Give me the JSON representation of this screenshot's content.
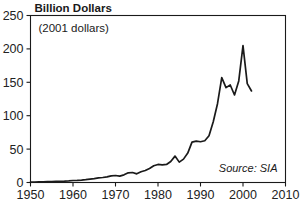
{
  "chart_data": {
    "type": "line",
    "title": "Billion Dollars",
    "subtitle": "(2001 dollars)",
    "annotation": "Source: SIA",
    "xlabel": "",
    "ylabel": "Billion Dollars",
    "xlim": [
      1950,
      2010
    ],
    "ylim": [
      0,
      250
    ],
    "grid": false,
    "legend": "none",
    "xticks": [
      "1950",
      "1960",
      "1970",
      "1980",
      "1990",
      "2000",
      "2010"
    ],
    "xtick_values": [
      1950,
      1960,
      1970,
      1980,
      1990,
      2000,
      2010
    ],
    "yticks": [
      "0",
      "50",
      "100",
      "150",
      "200",
      "250"
    ],
    "ytick_values": [
      0,
      50,
      100,
      150,
      200,
      250
    ],
    "line_color": "#1a1a1a",
    "x": [
      1950,
      1951,
      1952,
      1953,
      1954,
      1955,
      1956,
      1957,
      1958,
      1959,
      1960,
      1961,
      1962,
      1963,
      1964,
      1965,
      1966,
      1967,
      1968,
      1969,
      1970,
      1971,
      1972,
      1973,
      1974,
      1975,
      1976,
      1977,
      1978,
      1979,
      1980,
      1981,
      1982,
      1983,
      1984,
      1985,
      1986,
      1987,
      1988,
      1989,
      1990,
      1991,
      1992,
      1993,
      1994,
      1995,
      1996,
      1997,
      1998,
      1999,
      2000,
      2001,
      2002
    ],
    "values": [
      0.5,
      0.6,
      0.8,
      1.0,
      1.2,
      1.4,
      1.6,
      1.8,
      2.0,
      2.4,
      3.0,
      3.2,
      3.6,
      4.2,
      5.0,
      5.8,
      7.0,
      7.5,
      8.5,
      10.0,
      10.5,
      9.5,
      11.5,
      14.5,
      15.0,
      13.0,
      16.0,
      18.0,
      21.0,
      25.0,
      27.0,
      26.5,
      27.0,
      31.5,
      39.5,
      30.5,
      35.0,
      44.0,
      60.5,
      62.0,
      61.0,
      62.5,
      70.0,
      91.0,
      118.0,
      157.0,
      142.0,
      146.0,
      131.0,
      152.0,
      205.0,
      148.0,
      137.0
    ],
    "series": [
      {
        "name": "Worldwide semiconductor sales",
        "values": [
          0.5,
          0.6,
          0.8,
          1.0,
          1.2,
          1.4,
          1.6,
          1.8,
          2.0,
          2.4,
          3.0,
          3.2,
          3.6,
          4.2,
          5.0,
          5.8,
          7.0,
          7.5,
          8.5,
          10.0,
          10.5,
          9.5,
          11.5,
          14.5,
          15.0,
          13.0,
          16.0,
          18.0,
          21.0,
          25.0,
          27.0,
          26.5,
          27.0,
          31.5,
          39.5,
          30.5,
          35.0,
          44.0,
          60.5,
          62.0,
          61.0,
          62.5,
          70.0,
          91.0,
          118.0,
          157.0,
          142.0,
          146.0,
          131.0,
          152.0,
          205.0,
          148.0,
          137.0
        ]
      }
    ]
  }
}
